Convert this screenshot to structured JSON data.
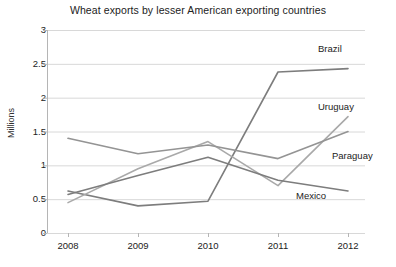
{
  "chart_data": {
    "type": "line",
    "title": "Wheat exports by lesser American exporting countries",
    "xlabel": "",
    "ylabel": "Millions",
    "categories": [
      "2008",
      "2009",
      "2010",
      "2011",
      "2012"
    ],
    "x": [
      2008,
      2009,
      2010,
      2011,
      2012
    ],
    "ylim": [
      0,
      3
    ],
    "y_ticks": [
      "0",
      "0.5",
      "1",
      "1.5",
      "2",
      "2.5",
      "3"
    ],
    "y_tick_values": [
      0,
      0.5,
      1,
      1.5,
      2,
      2.5,
      3
    ],
    "grid": true,
    "legend_position": "inline-right-labels",
    "series": [
      {
        "name": "Brazil",
        "values": [
          0.62,
          0.4,
          0.47,
          2.38,
          2.43
        ],
        "color": "#7d7d7d",
        "label_x": 318,
        "label_y": 44
      },
      {
        "name": "Uruguay",
        "values": [
          0.45,
          0.95,
          1.35,
          0.7,
          1.72
        ],
        "color": "#a9a9a9",
        "label_x": 318,
        "label_y": 102
      },
      {
        "name": "Paraguay",
        "values": [
          1.4,
          1.17,
          1.3,
          1.1,
          1.5
        ],
        "color": "#949494",
        "label_x": 332,
        "label_y": 151
      },
      {
        "name": "Mexico",
        "values": [
          0.57,
          0.85,
          1.12,
          0.78,
          0.62
        ],
        "color": "#7d7d7d",
        "label_x": 296,
        "label_y": 191
      }
    ],
    "geometry": {
      "plot_left": 47,
      "plot_right": 365,
      "plot_top": 30,
      "plot_bottom": 233,
      "x_positions": [
        68,
        138,
        208,
        278,
        348
      ],
      "grid_color": "#d8d8d8",
      "axis_color": "#b5b5b5"
    }
  }
}
